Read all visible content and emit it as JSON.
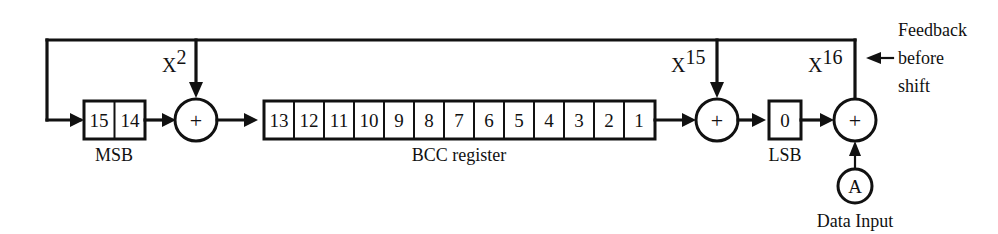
{
  "diagram": {
    "colors": {
      "line": "#111111",
      "background": "#ffffff"
    },
    "msb_group": {
      "label": "MSB",
      "cells": [
        "15",
        "14"
      ]
    },
    "bcc_register": {
      "label": "BCC register",
      "cells": [
        "13",
        "12",
        "11",
        "10",
        "9",
        "8",
        "7",
        "6",
        "5",
        "4",
        "3",
        "2",
        "1"
      ]
    },
    "lsb_group": {
      "label": "LSB",
      "cells": [
        "0"
      ]
    },
    "adders": [
      {
        "name": "adder-x2",
        "symbol": "+"
      },
      {
        "name": "adder-x15",
        "symbol": "+"
      },
      {
        "name": "adder-x16",
        "symbol": "+"
      }
    ],
    "taps": [
      {
        "name": "tap-x2",
        "base": "X",
        "exponent": "2"
      },
      {
        "name": "tap-x15",
        "base": "X",
        "exponent": "15"
      },
      {
        "name": "tap-x16",
        "base": "X",
        "exponent": "16"
      }
    ],
    "data_input": {
      "node_symbol": "A",
      "label": "Data Input"
    },
    "feedback_note": {
      "line1": "Feedback",
      "line2": "before",
      "line3": "shift"
    }
  }
}
